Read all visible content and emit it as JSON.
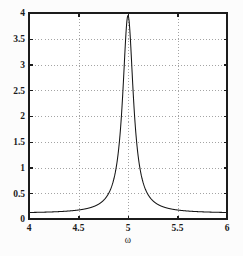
{
  "figure": {
    "background_color": "#fcfcfc",
    "plot_background_color": "#ffffff",
    "frame_color": "#1c1c1c",
    "grid_color": "#9a9a9a",
    "curve_color": "#151515"
  },
  "axis_titles": {
    "x": "ω",
    "y": ""
  },
  "chart_data": {
    "type": "line",
    "title": "",
    "subtitle": "",
    "xlabel": "ω",
    "ylabel": "",
    "xlim": [
      4,
      6
    ],
    "ylim": [
      0,
      4
    ],
    "xticks": [
      4,
      4.5,
      5,
      5.5,
      6
    ],
    "xticklabels": [
      "4",
      "4.5",
      "5",
      "5.5",
      "6"
    ],
    "yticks": [
      0,
      0.5,
      1,
      1.5,
      2,
      2.5,
      3,
      3.5,
      4
    ],
    "yticklabels": [
      "0",
      "0.5",
      "1",
      "1.5",
      "2",
      "2.5",
      "3",
      "3.5",
      "4"
    ],
    "grid": true,
    "grid_style": "dotted",
    "legend": null,
    "legend_position": "none",
    "annotations": [],
    "series": [
      {
        "name": "amplitude",
        "description": "Lorentzian resonance peak centered at omega = 5",
        "resonance_frequency": 5,
        "peak_value": 3.95,
        "half_width": 0.0655,
        "baseline_left": 0.11,
        "baseline_right": 0.11,
        "x": [
          4,
          4.1,
          4.2,
          4.3,
          4.4,
          4.5,
          4.6,
          4.7,
          4.75,
          4.8,
          4.85,
          4.9,
          4.93,
          4.95,
          4.97,
          4.99,
          5,
          5.01,
          5.03,
          5.05,
          5.07,
          5.1,
          5.15,
          5.2,
          5.25,
          5.3,
          5.4,
          5.5,
          5.6,
          5.7,
          5.8,
          5.9,
          6
        ],
        "values": [
          0.11,
          0.12,
          0.14,
          0.15,
          0.18,
          0.21,
          0.26,
          0.36,
          0.44,
          0.57,
          0.79,
          1.23,
          1.74,
          2.35,
          3.14,
          3.83,
          3.95,
          3.83,
          3.14,
          2.35,
          1.74,
          1.23,
          0.79,
          0.57,
          0.44,
          0.36,
          0.26,
          0.21,
          0.18,
          0.15,
          0.14,
          0.12,
          0.11
        ]
      }
    ]
  }
}
